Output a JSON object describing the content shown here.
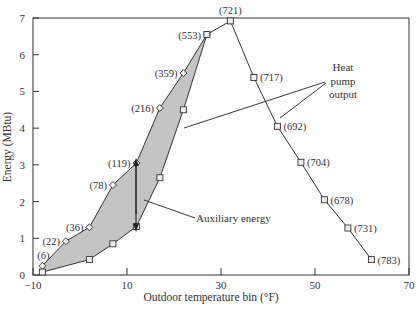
{
  "chart_data": {
    "type": "line",
    "title": "",
    "xlabel": "Outdoor temperature bin (°F)",
    "ylabel": "Energy (MBtu)",
    "xlim": [
      -10,
      70
    ],
    "ylim": [
      0,
      7
    ],
    "x_ticks": [
      -10,
      10,
      30,
      50,
      70
    ],
    "y_ticks": [
      0,
      1,
      2,
      3,
      4,
      5,
      6,
      7
    ],
    "grid": false,
    "series": [
      {
        "name": "Total heating load (with hours)",
        "marker": "diamond",
        "x": [
          -8,
          -3,
          2,
          7,
          12,
          17,
          22,
          27
        ],
        "values": [
          0.25,
          0.92,
          1.3,
          2.45,
          3.05,
          4.55,
          5.5,
          6.55
        ],
        "point_labels": [
          "(6)",
          "(22)",
          "(36)",
          "(78)",
          "(119)",
          "(216)",
          "(359)",
          "(553)"
        ]
      },
      {
        "name": "Heat pump output",
        "marker": "square",
        "x": [
          -8,
          2,
          7,
          12,
          17,
          22,
          27,
          32,
          37,
          42,
          47,
          52,
          57,
          62
        ],
        "values": [
          0.08,
          0.42,
          0.85,
          1.32,
          2.65,
          4.5,
          6.55,
          6.92,
          5.38,
          4.05,
          3.07,
          2.05,
          1.28,
          0.42
        ],
        "point_labels": [
          "",
          "",
          "",
          "",
          "",
          "",
          "",
          "(721)",
          "(717)",
          "(692)",
          "(704)",
          "(678)",
          "(731)",
          "(783)"
        ]
      }
    ],
    "shaded_region": "Auxiliary energy (area between total load and heat pump output)",
    "annotations": [
      {
        "text": "Heat pump output",
        "lines": [
          "Heat",
          "pump",
          "output"
        ]
      },
      {
        "text": "Auxiliary energy"
      }
    ]
  },
  "labels": {
    "xlabel": "Outdoor temperature bin (°F)",
    "ylabel": "Energy (MBtu)",
    "annot_heat": [
      "Heat",
      "pump",
      "output"
    ],
    "annot_aux": "Auxiliary energy"
  }
}
